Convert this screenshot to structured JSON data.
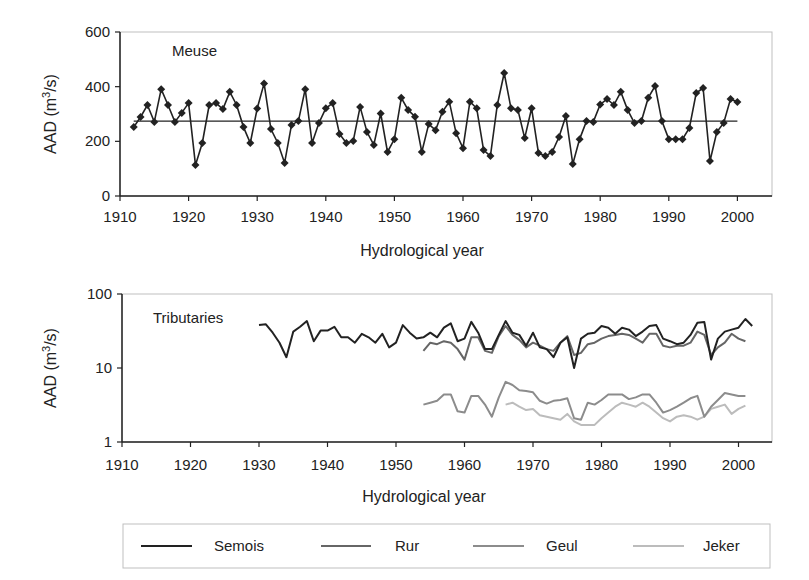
{
  "figure": {
    "width": 809,
    "height": 580
  },
  "chart_data": [
    {
      "type": "line",
      "panel": "top",
      "label": "Meuse",
      "xlabel": "Hydrological year",
      "ylabel": "AAD (m³/s)",
      "ylabel_parts": {
        "main": "AAD (m",
        "sup": "3",
        "tail": "/s)"
      },
      "xlim": [
        1910,
        2005
      ],
      "ylim": [
        0,
        600
      ],
      "yscale": "linear",
      "xticks": [
        1910,
        1920,
        1930,
        1940,
        1950,
        1960,
        1970,
        1980,
        1990,
        2000
      ],
      "yticks": [
        0,
        200,
        400,
        600
      ],
      "grid": false,
      "marker": "diamond",
      "color": "#222222",
      "mean_line": {
        "value": 274,
        "x_start": 1912,
        "x_end": 2000
      },
      "series": [
        {
          "name": "Meuse",
          "x": [
            1912,
            1913,
            1914,
            1915,
            1916,
            1917,
            1918,
            1919,
            1920,
            1921,
            1922,
            1923,
            1924,
            1925,
            1926,
            1927,
            1928,
            1929,
            1930,
            1931,
            1932,
            1933,
            1934,
            1935,
            1936,
            1937,
            1938,
            1939,
            1940,
            1941,
            1942,
            1943,
            1944,
            1945,
            1946,
            1947,
            1948,
            1949,
            1950,
            1951,
            1952,
            1953,
            1954,
            1955,
            1956,
            1957,
            1958,
            1959,
            1960,
            1961,
            1962,
            1963,
            1964,
            1965,
            1966,
            1967,
            1968,
            1969,
            1970,
            1971,
            1972,
            1973,
            1974,
            1975,
            1976,
            1977,
            1978,
            1979,
            1980,
            1981,
            1982,
            1983,
            1984,
            1985,
            1986,
            1987,
            1988,
            1989,
            1990,
            1991,
            1992,
            1993,
            1994,
            1995,
            1996,
            1997,
            1998,
            1999,
            2000
          ],
          "values": [
            252,
            289,
            333,
            271,
            391,
            333,
            271,
            304,
            340,
            113,
            194,
            333,
            340,
            318,
            381,
            333,
            252,
            194,
            320,
            412,
            245,
            194,
            121,
            260,
            274,
            391,
            194,
            267,
            321,
            340,
            227,
            194,
            201,
            326,
            234,
            187,
            302,
            161,
            208,
            359,
            315,
            290,
            161,
            263,
            241,
            308,
            345,
            230,
            175,
            345,
            321,
            168,
            146,
            333,
            450,
            321,
            315,
            212,
            321,
            157,
            146,
            161,
            216,
            293,
            117,
            208,
            274,
            271,
            335,
            355,
            333,
            381,
            315,
            267,
            274,
            359,
            402,
            274,
            208,
            208,
            208,
            249,
            377,
            395,
            128,
            234,
            267,
            355,
            344
          ]
        }
      ]
    },
    {
      "type": "line",
      "panel": "bottom",
      "label": "Tributaries",
      "xlabel": "Hydrological year",
      "ylabel": "AAD (m³/s)",
      "ylabel_parts": {
        "main": "AAD (m",
        "sup": "3",
        "tail": "/s)"
      },
      "xlim": [
        1910,
        2005
      ],
      "ylim": [
        1,
        100
      ],
      "yscale": "log",
      "xticks": [
        1910,
        1920,
        1930,
        1940,
        1950,
        1960,
        1970,
        1980,
        1990,
        2000
      ],
      "yticks": [
        1,
        10,
        100
      ],
      "grid": false,
      "legend_position": "bottom",
      "series": [
        {
          "name": "Semois",
          "color": "#222222",
          "x": [
            1930,
            1931,
            1932,
            1933,
            1934,
            1935,
            1936,
            1937,
            1938,
            1939,
            1940,
            1941,
            1942,
            1943,
            1944,
            1945,
            1946,
            1947,
            1948,
            1949,
            1950,
            1951,
            1952,
            1953,
            1954,
            1955,
            1956,
            1957,
            1958,
            1959,
            1960,
            1961,
            1962,
            1963,
            1964,
            1965,
            1966,
            1967,
            1968,
            1969,
            1970,
            1971,
            1972,
            1973,
            1974,
            1975,
            1976,
            1977,
            1978,
            1979,
            1980,
            1981,
            1982,
            1983,
            1984,
            1985,
            1986,
            1987,
            1988,
            1989,
            1990,
            1991,
            1992,
            1993,
            1994,
            1995,
            1996,
            1997,
            1998,
            1999,
            2000,
            2001,
            2002
          ],
          "values": [
            38,
            39,
            30,
            22,
            14,
            31,
            36,
            43,
            23,
            32,
            32,
            36,
            26,
            26,
            22,
            29,
            26,
            22,
            29,
            19,
            22,
            38,
            30,
            25,
            26,
            30,
            26,
            35,
            40,
            23,
            25,
            42,
            30,
            18,
            18,
            28,
            43,
            30,
            28,
            20,
            30,
            19,
            18,
            14,
            22,
            26,
            10,
            25,
            29,
            30,
            37,
            35,
            29,
            35,
            33,
            27,
            31,
            37,
            38,
            25,
            23,
            21,
            22,
            28,
            41,
            42,
            13,
            25,
            31,
            33,
            35,
            46,
            37
          ]
        },
        {
          "name": "Rur",
          "color": "#666666",
          "x": [
            1954,
            1955,
            1956,
            1957,
            1958,
            1959,
            1960,
            1961,
            1962,
            1963,
            1964,
            1965,
            1966,
            1967,
            1968,
            1969,
            1970,
            1971,
            1972,
            1973,
            1974,
            1975,
            1976,
            1977,
            1978,
            1979,
            1980,
            1981,
            1982,
            1983,
            1984,
            1985,
            1986,
            1987,
            1988,
            1989,
            1990,
            1991,
            1992,
            1993,
            1994,
            1995,
            1996,
            1997,
            1998,
            1999,
            2000,
            2001
          ],
          "values": [
            17,
            22,
            21,
            23,
            22,
            18,
            13,
            26,
            26,
            17,
            16,
            27,
            37,
            28,
            24,
            19,
            22,
            20,
            18,
            17,
            22,
            27,
            15,
            16,
            21,
            22,
            25,
            27,
            28,
            29,
            28,
            25,
            22,
            29,
            29,
            20,
            19,
            20,
            20,
            22,
            31,
            28,
            15,
            19,
            22,
            29,
            25,
            23
          ]
        },
        {
          "name": "Geul",
          "color": "#8c8c8c",
          "x": [
            1954,
            1955,
            1956,
            1957,
            1958,
            1959,
            1960,
            1961,
            1962,
            1963,
            1964,
            1965,
            1966,
            1967,
            1968,
            1969,
            1970,
            1971,
            1972,
            1973,
            1974,
            1975,
            1976,
            1977,
            1978,
            1979,
            1980,
            1981,
            1982,
            1983,
            1984,
            1985,
            1986,
            1987,
            1988,
            1989,
            1990,
            1991,
            1992,
            1993,
            1994,
            1995,
            1996,
            1997,
            1998,
            1999,
            2000,
            2001
          ],
          "values": [
            3.2,
            3.4,
            3.6,
            4.4,
            4.4,
            2.6,
            2.5,
            4.2,
            4.2,
            3.2,
            2.2,
            4.0,
            6.5,
            5.9,
            5.0,
            4.9,
            4.7,
            3.6,
            3.3,
            3.6,
            3.7,
            3.9,
            2.1,
            2.0,
            3.4,
            3.2,
            3.7,
            4.4,
            4.4,
            4.4,
            3.8,
            4.0,
            4.4,
            4.4,
            3.4,
            2.5,
            2.7,
            3.0,
            3.4,
            3.9,
            4.2,
            2.2,
            3.0,
            3.7,
            4.6,
            4.4,
            4.2,
            4.2
          ]
        },
        {
          "name": "Jeker",
          "color": "#bcbcbc",
          "x": [
            1966,
            1967,
            1968,
            1969,
            1970,
            1971,
            1972,
            1973,
            1974,
            1975,
            1976,
            1977,
            1978,
            1979,
            1980,
            1981,
            1982,
            1983,
            1984,
            1985,
            1986,
            1987,
            1988,
            1989,
            1990,
            1991,
            1992,
            1993,
            1994,
            1995,
            1996,
            1997,
            1998,
            1999,
            2000,
            2001
          ],
          "values": [
            3.2,
            3.4,
            3.0,
            2.7,
            2.8,
            2.3,
            2.2,
            2.1,
            2.0,
            2.4,
            1.9,
            1.7,
            1.7,
            1.7,
            2.1,
            2.5,
            3.0,
            3.4,
            3.2,
            3.0,
            3.4,
            3.0,
            2.5,
            2.1,
            1.9,
            2.2,
            2.3,
            2.2,
            2.0,
            2.2,
            2.8,
            3.0,
            3.2,
            2.4,
            2.8,
            3.1
          ]
        }
      ]
    }
  ],
  "top": {
    "panel_label": "Meuse",
    "xlabel": "Hydrological year",
    "ylabel_main": "AAD (m",
    "ylabel_sup": "3",
    "ylabel_tail": "/s)"
  },
  "bottom": {
    "panel_label": "Tributaries",
    "xlabel": "Hydrological year",
    "ylabel_main": "AAD (m",
    "ylabel_sup": "3",
    "ylabel_tail": "/s)"
  },
  "legend": {
    "items": [
      {
        "label": "Semois",
        "color": "#222222"
      },
      {
        "label": "Rur",
        "color": "#666666"
      },
      {
        "label": "Geul",
        "color": "#8c8c8c"
      },
      {
        "label": "Jeker",
        "color": "#bcbcbc"
      }
    ]
  }
}
